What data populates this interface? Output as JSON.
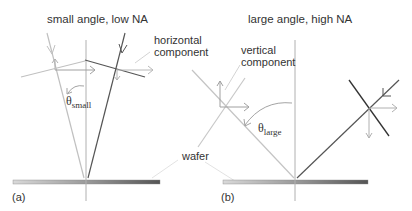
{
  "panels": {
    "a": {
      "title": "small angle, low NA",
      "tag": "(a)",
      "component_label_line1": "horizontal",
      "component_label_line2": "component",
      "angle_symbol": "θ",
      "angle_subscript": "small"
    },
    "b": {
      "title": "large angle, high NA",
      "tag": "(b)",
      "component_label_line1": "vertical",
      "component_label_line2": "component",
      "angle_symbol": "θ",
      "angle_subscript": "large"
    }
  },
  "shared": {
    "wafer_label": "wafer"
  },
  "colors": {
    "incident_ray": "#c8c8c8",
    "reflected_ray": "#555555",
    "normal_line": "#aaaaaa",
    "wafer_light": "#d4d4d4",
    "wafer_dark": "#555555",
    "text": "#333333"
  }
}
